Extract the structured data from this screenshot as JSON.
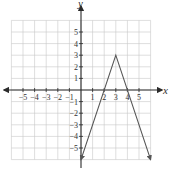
{
  "chart_data": {
    "type": "line",
    "title": "",
    "function": "y = -3|x - 3| + 3",
    "xlabel": "x",
    "ylabel": "y",
    "xlim": [
      -6,
      6
    ],
    "ylim": [
      -6,
      6
    ],
    "grid": true,
    "x_ticks": [
      -5,
      -4,
      -3,
      -2,
      -1,
      1,
      2,
      3,
      4,
      5
    ],
    "y_ticks": [
      -5,
      -4,
      -3,
      -2,
      -1,
      1,
      2,
      3,
      4,
      5
    ],
    "series": [
      {
        "name": "piecewise linear (absolute value)",
        "x": [
          0,
          3,
          6
        ],
        "y": [
          -6,
          3,
          -6
        ],
        "arrows": [
          "start",
          "end"
        ]
      }
    ],
    "annotations": {
      "vertex": [
        3,
        3
      ],
      "x_intercepts": [
        2,
        4
      ],
      "y_intercept": -6
    }
  },
  "labels": {
    "x_axis": "x",
    "y_axis": "y"
  }
}
